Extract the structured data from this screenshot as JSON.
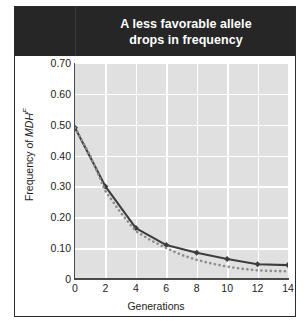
{
  "figure": {
    "title_line1": "A less favorable allele",
    "title_line2": "drops in frequency",
    "title_background": "#262626",
    "title_color": "#ffffff",
    "border_color": "#2b2b2b"
  },
  "chart_data": {
    "type": "line",
    "title": "A less favorable allele drops in frequency",
    "xlabel": "Generations",
    "ylabel": "Frequency of MDH^F",
    "ylabel_parts": {
      "prefix": "Frequency of ",
      "italic": "MDH",
      "superscript": "F"
    },
    "xlim": [
      0,
      14
    ],
    "ylim": [
      0,
      0.7
    ],
    "grid": true,
    "grid_color": "#ffffff",
    "plot_background": "#e0e0e0",
    "legend": "none",
    "xticks": [
      0,
      2,
      4,
      6,
      8,
      10,
      12,
      14
    ],
    "xtick_labels": [
      "0",
      "2",
      "4",
      "6",
      "8",
      "10",
      "12",
      "14"
    ],
    "yticks": [
      0,
      0.1,
      0.2,
      0.3,
      0.4,
      0.5,
      0.6,
      0.7
    ],
    "ytick_labels": [
      "0",
      "0.10",
      "0.20",
      "0.30",
      "0.40",
      "0.50",
      "0.60",
      "0.70"
    ],
    "series": [
      {
        "name": "Observed allele frequency",
        "style": "solid",
        "color": "#3d3d3d",
        "marker": "diamond",
        "x": [
          0,
          2,
          4,
          6,
          8,
          10,
          12,
          14
        ],
        "values": [
          0.49,
          0.3,
          0.165,
          0.11,
          0.085,
          0.065,
          0.048,
          0.045
        ]
      },
      {
        "name": "Expected allele frequency",
        "style": "dotted",
        "color": "#8c8c8c",
        "marker": "none",
        "x": [
          0,
          1,
          2,
          3,
          4,
          5,
          6,
          7,
          8,
          9,
          10,
          11,
          12,
          13,
          14
        ],
        "values": [
          0.49,
          0.4,
          0.285,
          0.215,
          0.155,
          0.125,
          0.1,
          0.078,
          0.062,
          0.05,
          0.04,
          0.033,
          0.028,
          0.026,
          0.025
        ]
      }
    ]
  }
}
